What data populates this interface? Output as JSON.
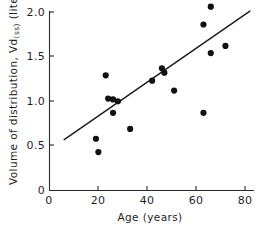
{
  "chart_data": {
    "type": "scatter",
    "title": "",
    "xlabel": "Age (years)",
    "ylabel": "Volume of distribution, Vd(ss) (liters/kg)",
    "ylabel_parts": {
      "main_prefix": "Volume of distribution, Vd",
      "subscript": "(ss)",
      "main_suffix": " (liters/kg)"
    },
    "xlim": [
      0,
      92
    ],
    "ylim": [
      0,
      2.12
    ],
    "grid": false,
    "legend": null,
    "xticks": [
      0,
      20,
      40,
      60,
      80
    ],
    "xtick_labels": [
      "0",
      "20",
      "40",
      "60",
      "80"
    ],
    "yticks": [
      0,
      0.5,
      1.0,
      1.5,
      2.0
    ],
    "ytick_labels": [
      "0",
      "0.5",
      "1.0",
      "1.5",
      "2.0"
    ],
    "point_color": "#111111",
    "line_color": "#1a1a1a",
    "axis_color": "#2b2b2b",
    "marker": "filled-circle",
    "marker_size_px": 3.1,
    "points": [
      {
        "x": 20,
        "y": 0.43
      },
      {
        "x": 19,
        "y": 0.58
      },
      {
        "x": 23,
        "y": 1.29
      },
      {
        "x": 24,
        "y": 1.03
      },
      {
        "x": 26,
        "y": 1.02
      },
      {
        "x": 28,
        "y": 1.0
      },
      {
        "x": 26,
        "y": 0.87
      },
      {
        "x": 33,
        "y": 0.69
      },
      {
        "x": 42,
        "y": 1.23
      },
      {
        "x": 46,
        "y": 1.37
      },
      {
        "x": 47,
        "y": 1.32
      },
      {
        "x": 51,
        "y": 1.12
      },
      {
        "x": 63,
        "y": 0.87
      },
      {
        "x": 63,
        "y": 1.86
      },
      {
        "x": 66,
        "y": 2.06
      },
      {
        "x": 66,
        "y": 1.54
      },
      {
        "x": 72,
        "y": 1.62
      }
    ],
    "regression_line": {
      "x_start": 6,
      "y_start": 0.57,
      "x_end": 82,
      "y_end": 2.01
    }
  }
}
